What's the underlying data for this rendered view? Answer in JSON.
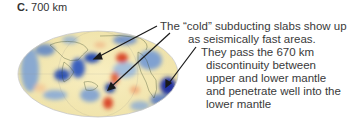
{
  "figure": {
    "panel_label": "C.",
    "depth_label": "700 km",
    "caption_lines": [
      "The “cold” subducting slabs show up",
      "as seismically fast areas.",
      "They pass the 670 km",
      "discontinuity between",
      "upper and lower mantle",
      "and penetrate well into the",
      "lower mantle"
    ],
    "map_type": "seismic-tomography-globe",
    "colors": {
      "fast": "#2a4fb0",
      "slow": "#d9482a",
      "neutral": "#f6edb8",
      "arrow": "#1a1a1a"
    },
    "arrows": 3
  }
}
